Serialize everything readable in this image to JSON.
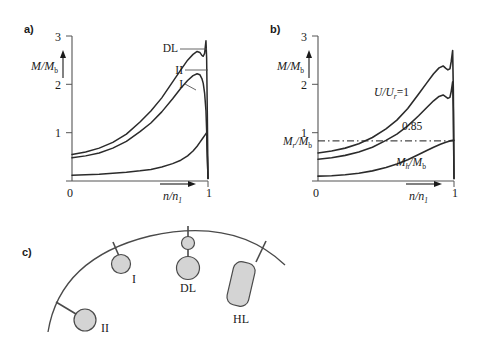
{
  "figure": {
    "panels": [
      {
        "tag": "a)"
      },
      {
        "tag": "b)"
      },
      {
        "tag": "c)"
      }
    ]
  },
  "panel_a": {
    "tag": "a)",
    "y_axis_label_main": "M/M",
    "y_axis_label_sub": "b",
    "x_axis_label_main": "n/n",
    "x_axis_label_sub": "1",
    "y_ticks": [
      "1",
      "2",
      "3"
    ],
    "x_ticks": [
      "0",
      "1"
    ],
    "curve_labels": [
      "DL",
      "II",
      "I"
    ]
  },
  "panel_b": {
    "tag": "b)",
    "y_axis_label_main": "M/M",
    "y_axis_label_sub": "b",
    "x_axis_label_main": "n/n",
    "x_axis_label_sub": "1",
    "y_ticks": [
      "1",
      "2",
      "3"
    ],
    "x_ticks": [
      "0",
      "1"
    ],
    "curve_label_top_main": "U/U",
    "curve_label_top_sub": "r",
    "curve_label_top_tail": "=1",
    "curve_label_mid": "0.85",
    "curve_label_bottom_main": "M",
    "curve_label_bottom_sub": "h",
    "curve_label_bottom_tail": "/M",
    "curve_label_bottom_sub2": "b",
    "dashed_label_main": "M",
    "dashed_label_sub": "r",
    "dashed_label_tail": "/M",
    "dashed_label_sub2": "b"
  },
  "panel_c": {
    "tag": "c)",
    "items": [
      {
        "label": "I"
      },
      {
        "label": "DL"
      },
      {
        "label": "HL"
      },
      {
        "label": "II"
      }
    ]
  },
  "chart_data": [
    {
      "type": "line",
      "title": "a)",
      "xlabel": "n/n1",
      "ylabel": "M/Mb",
      "xlim": [
        0,
        1
      ],
      "ylim": [
        0,
        3
      ],
      "yticks": [
        1,
        2,
        3
      ],
      "xticks": [
        0,
        1
      ],
      "grid": false,
      "legend": "inline-leader-labels",
      "series": [
        {
          "name": "DL",
          "x": [
            0.0,
            0.1,
            0.2,
            0.3,
            0.4,
            0.5,
            0.58,
            0.66,
            0.74,
            0.8,
            0.85,
            0.89,
            0.92,
            0.94,
            0.955,
            0.965,
            0.975,
            0.985,
            0.99,
            0.995,
            1.0
          ],
          "values": [
            0.55,
            0.6,
            0.68,
            0.8,
            0.97,
            1.22,
            1.45,
            1.72,
            2.05,
            2.3,
            2.5,
            2.62,
            2.68,
            2.66,
            2.6,
            2.58,
            2.64,
            2.9,
            2.55,
            1.4,
            0.05
          ]
        },
        {
          "name": "II",
          "x": [
            0.0,
            0.1,
            0.2,
            0.3,
            0.4,
            0.5,
            0.58,
            0.66,
            0.74,
            0.8,
            0.85,
            0.89,
            0.92,
            0.94,
            0.955,
            0.965,
            0.975,
            0.985,
            0.99,
            0.995,
            1.0
          ],
          "values": [
            0.48,
            0.52,
            0.58,
            0.68,
            0.82,
            1.02,
            1.2,
            1.43,
            1.7,
            1.92,
            2.08,
            2.18,
            2.22,
            2.2,
            2.12,
            2.02,
            1.82,
            1.45,
            1.05,
            0.5,
            0.05
          ]
        },
        {
          "name": "I",
          "x": [
            0.0,
            0.1,
            0.2,
            0.3,
            0.4,
            0.5,
            0.58,
            0.66,
            0.74,
            0.8,
            0.85,
            0.89,
            0.92,
            0.94,
            0.96,
            0.98,
            0.99,
            1.0
          ],
          "values": [
            0.12,
            0.13,
            0.14,
            0.16,
            0.18,
            0.21,
            0.24,
            0.29,
            0.36,
            0.43,
            0.52,
            0.62,
            0.72,
            0.8,
            0.88,
            0.96,
            1.0,
            0.05
          ]
        }
      ]
    },
    {
      "type": "line",
      "title": "b)",
      "xlabel": "n/n1",
      "ylabel": "M/Mb",
      "xlim": [
        0,
        1
      ],
      "ylim": [
        0,
        3
      ],
      "yticks": [
        1,
        2,
        3
      ],
      "xticks": [
        0,
        1
      ],
      "grid": false,
      "reference_lines": [
        {
          "name": "Mr/Mb",
          "type": "dash-dot",
          "y": 0.83,
          "orientation": "horizontal"
        }
      ],
      "series": [
        {
          "name": "U/Ur=1",
          "x": [
            0.0,
            0.1,
            0.2,
            0.3,
            0.4,
            0.5,
            0.58,
            0.66,
            0.74,
            0.8,
            0.85,
            0.89,
            0.92,
            0.94,
            0.955,
            0.97,
            0.98,
            0.99,
            0.995,
            1.0
          ],
          "values": [
            0.58,
            0.62,
            0.68,
            0.77,
            0.9,
            1.08,
            1.26,
            1.5,
            1.8,
            2.03,
            2.22,
            2.34,
            2.38,
            2.33,
            2.3,
            2.32,
            2.48,
            2.7,
            1.9,
            0.05
          ]
        },
        {
          "name": "0.85",
          "x": [
            0.0,
            0.1,
            0.2,
            0.3,
            0.4,
            0.5,
            0.58,
            0.66,
            0.74,
            0.8,
            0.85,
            0.89,
            0.92,
            0.94,
            0.955,
            0.97,
            0.98,
            0.99,
            0.995,
            1.0
          ],
          "values": [
            0.45,
            0.48,
            0.53,
            0.6,
            0.7,
            0.84,
            0.97,
            1.14,
            1.35,
            1.52,
            1.66,
            1.75,
            1.78,
            1.74,
            1.71,
            1.73,
            1.86,
            2.05,
            1.45,
            0.05
          ]
        },
        {
          "name": "Mh/Mb",
          "x": [
            0.0,
            0.1,
            0.2,
            0.3,
            0.4,
            0.5,
            0.58,
            0.66,
            0.74,
            0.8,
            0.85,
            0.9,
            0.94,
            0.97,
            0.99,
            1.0
          ],
          "values": [
            0.1,
            0.11,
            0.13,
            0.16,
            0.21,
            0.28,
            0.35,
            0.44,
            0.55,
            0.63,
            0.7,
            0.76,
            0.8,
            0.83,
            0.84,
            0.84
          ]
        }
      ]
    }
  ],
  "colors": {
    "curve": "#2b2b2b",
    "axis": "#555555",
    "schematic_fill": "#d4d4d4",
    "schematic_stroke": "#4a4a4a",
    "text": "#1a1a1a"
  }
}
